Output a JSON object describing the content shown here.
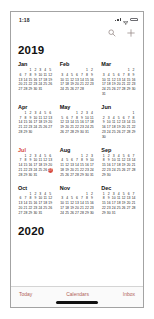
{
  "status_bar": {
    "time": "1:18",
    "icons": [
      "cellular-signal",
      "wifi",
      "battery"
    ]
  },
  "nav_bar": {
    "search_icon": "magnifier-icon",
    "add_icon": "plus-icon"
  },
  "year": {
    "title": "2019"
  },
  "next_year": {
    "title": "2020"
  },
  "calendar": {
    "week_start": "Sunday",
    "current_month": "Jul",
    "today": {
      "month": "Jul",
      "day": 27
    },
    "months": [
      {
        "name": "Jan",
        "weeks": [
          [
            0,
            0,
            1,
            2,
            3,
            4,
            5
          ],
          [
            6,
            7,
            8,
            9,
            10,
            11,
            12
          ],
          [
            13,
            14,
            15,
            16,
            17,
            18,
            19
          ],
          [
            20,
            21,
            22,
            23,
            24,
            25,
            26
          ],
          [
            27,
            28,
            29,
            30,
            31,
            0,
            0
          ]
        ]
      },
      {
        "name": "Feb",
        "weeks": [
          [
            0,
            0,
            0,
            0,
            0,
            1,
            2
          ],
          [
            3,
            4,
            5,
            6,
            7,
            8,
            9
          ],
          [
            10,
            11,
            12,
            13,
            14,
            15,
            16
          ],
          [
            17,
            18,
            19,
            20,
            21,
            22,
            23
          ],
          [
            24,
            25,
            26,
            27,
            28,
            0,
            0
          ]
        ]
      },
      {
        "name": "Mar",
        "weeks": [
          [
            0,
            0,
            0,
            0,
            0,
            1,
            2
          ],
          [
            3,
            4,
            5,
            6,
            7,
            8,
            9
          ],
          [
            10,
            11,
            12,
            13,
            14,
            15,
            16
          ],
          [
            17,
            18,
            19,
            20,
            21,
            22,
            23
          ],
          [
            24,
            25,
            26,
            27,
            28,
            29,
            30
          ],
          [
            31,
            0,
            0,
            0,
            0,
            0,
            0
          ]
        ]
      },
      {
        "name": "Apr",
        "weeks": [
          [
            0,
            1,
            2,
            3,
            4,
            5,
            6
          ],
          [
            7,
            8,
            9,
            10,
            11,
            12,
            13
          ],
          [
            14,
            15,
            16,
            17,
            18,
            19,
            20
          ],
          [
            21,
            22,
            23,
            24,
            25,
            26,
            27
          ],
          [
            28,
            29,
            30,
            0,
            0,
            0,
            0
          ]
        ]
      },
      {
        "name": "May",
        "weeks": [
          [
            0,
            0,
            0,
            1,
            2,
            3,
            4
          ],
          [
            5,
            6,
            7,
            8,
            9,
            10,
            11
          ],
          [
            12,
            13,
            14,
            15,
            16,
            17,
            18
          ],
          [
            19,
            20,
            21,
            22,
            23,
            24,
            25
          ],
          [
            26,
            27,
            28,
            29,
            30,
            31,
            0
          ]
        ]
      },
      {
        "name": "Jun",
        "weeks": [
          [
            0,
            0,
            0,
            0,
            0,
            0,
            1
          ],
          [
            2,
            3,
            4,
            5,
            6,
            7,
            8
          ],
          [
            9,
            10,
            11,
            12,
            13,
            14,
            15
          ],
          [
            16,
            17,
            18,
            19,
            20,
            21,
            22
          ],
          [
            23,
            24,
            25,
            26,
            27,
            28,
            29
          ],
          [
            30,
            0,
            0,
            0,
            0,
            0,
            0
          ]
        ]
      },
      {
        "name": "Jul",
        "weeks": [
          [
            0,
            1,
            2,
            3,
            4,
            5,
            6
          ],
          [
            7,
            8,
            9,
            10,
            11,
            12,
            13
          ],
          [
            14,
            15,
            16,
            17,
            18,
            19,
            20
          ],
          [
            21,
            22,
            23,
            24,
            25,
            26,
            27
          ],
          [
            28,
            29,
            30,
            31,
            0,
            0,
            0
          ]
        ]
      },
      {
        "name": "Aug",
        "weeks": [
          [
            0,
            0,
            0,
            0,
            1,
            2,
            3
          ],
          [
            4,
            5,
            6,
            7,
            8,
            9,
            10
          ],
          [
            11,
            12,
            13,
            14,
            15,
            16,
            17
          ],
          [
            18,
            19,
            20,
            21,
            22,
            23,
            24
          ],
          [
            25,
            26,
            27,
            28,
            29,
            30,
            31
          ]
        ]
      },
      {
        "name": "Sep",
        "weeks": [
          [
            1,
            2,
            3,
            4,
            5,
            6,
            7
          ],
          [
            8,
            9,
            10,
            11,
            12,
            13,
            14
          ],
          [
            15,
            16,
            17,
            18,
            19,
            20,
            21
          ],
          [
            22,
            23,
            24,
            25,
            26,
            27,
            28
          ],
          [
            29,
            30,
            0,
            0,
            0,
            0,
            0
          ]
        ]
      },
      {
        "name": "Oct",
        "weeks": [
          [
            0,
            0,
            1,
            2,
            3,
            4,
            5
          ],
          [
            6,
            7,
            8,
            9,
            10,
            11,
            12
          ],
          [
            13,
            14,
            15,
            16,
            17,
            18,
            19
          ],
          [
            20,
            21,
            22,
            23,
            24,
            25,
            26
          ],
          [
            27,
            28,
            29,
            30,
            31,
            0,
            0
          ]
        ]
      },
      {
        "name": "Nov",
        "weeks": [
          [
            0,
            0,
            0,
            0,
            0,
            1,
            2
          ],
          [
            3,
            4,
            5,
            6,
            7,
            8,
            9
          ],
          [
            10,
            11,
            12,
            13,
            14,
            15,
            16
          ],
          [
            17,
            18,
            19,
            20,
            21,
            22,
            23
          ],
          [
            24,
            25,
            26,
            27,
            28,
            29,
            30
          ]
        ]
      },
      {
        "name": "Dec",
        "weeks": [
          [
            1,
            2,
            3,
            4,
            5,
            6,
            7
          ],
          [
            8,
            9,
            10,
            11,
            12,
            13,
            14
          ],
          [
            15,
            16,
            17,
            18,
            19,
            20,
            21
          ],
          [
            22,
            23,
            24,
            25,
            26,
            27,
            28
          ],
          [
            29,
            30,
            31,
            0,
            0,
            0,
            0
          ]
        ]
      }
    ]
  },
  "tab_bar": {
    "items": [
      {
        "label": "Today"
      },
      {
        "label": "Calendars"
      },
      {
        "label": "Inbox"
      }
    ]
  },
  "colors": {
    "accent": "#b05e57",
    "month_current": "#d6493e",
    "today_bg": "#d6493e",
    "text": "#1c1c1e"
  }
}
